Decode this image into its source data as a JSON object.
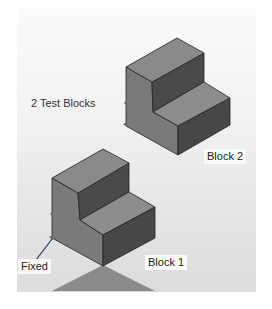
{
  "figure": {
    "caption": "2 Test Blocks",
    "blocks": [
      {
        "id": "block-1",
        "label": "Block 1"
      },
      {
        "id": "block-2",
        "label": "Block 2"
      }
    ],
    "constraint_label": "Fixed",
    "colors": {
      "panel_top": "#fbfbfb",
      "panel_bottom": "#dcdcdc",
      "face_top": "#8a8a8a",
      "face_left": "#7a7a7a",
      "face_right": "#4a4a4a",
      "edge": "#222222",
      "shadow": "#7d7d7d"
    }
  }
}
